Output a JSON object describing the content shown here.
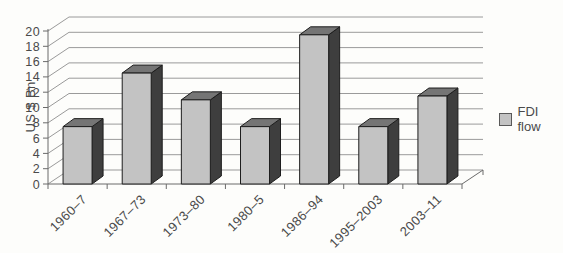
{
  "chart_data": {
    "type": "bar",
    "style": "3d-column",
    "title": "",
    "xlabel": "",
    "ylabel": "US $ Bn",
    "categories": [
      "1960–7",
      "1967–73",
      "1973–80",
      "1980–5",
      "1986–94",
      "1995–2003",
      "2003–11"
    ],
    "series": [
      {
        "name": "FDI flow",
        "values": [
          7.5,
          14.5,
          11,
          7.5,
          19.5,
          7.5,
          11.5
        ]
      }
    ],
    "ylim": [
      0,
      20
    ],
    "ytick_step": 2,
    "ytick_labels": [
      "0",
      "2",
      "4",
      "6",
      "8",
      "10",
      "12",
      "14",
      "16",
      "18",
      "20"
    ],
    "grid": true,
    "legend": {
      "position": "right",
      "entries": [
        "FDI flow"
      ]
    },
    "colors": {
      "background": "#fdfdfb",
      "bar_front": "#c3c3c3",
      "bar_side": "#3e3e3e",
      "bar_top": "#757575",
      "bar_edge": "#1d1d1d",
      "gridline": "#9a9a9a",
      "axis": "#6a6a6a",
      "text": "#4a4a4a",
      "legend_swatch": "#c3c3c3",
      "legend_swatch_border": "#595959"
    }
  }
}
